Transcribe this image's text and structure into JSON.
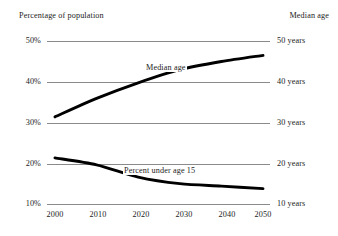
{
  "axis_titles": {
    "left": "Percentage of population",
    "right": "Median age"
  },
  "left_ticks": [
    "50%",
    "40%",
    "30%",
    "20%",
    "10%"
  ],
  "right_ticks": [
    "50 years",
    "40 years",
    "30 years",
    "20 years",
    "10 years"
  ],
  "x_ticks": [
    "2000",
    "2010",
    "2020",
    "2030",
    "2040",
    "2050"
  ],
  "series_labels": {
    "median": "Median age",
    "under15": "Percent under age 15"
  },
  "colors": {
    "line": "#000000",
    "gridline": "#8a8a8a",
    "background": "#ffffff",
    "text": "#1c1c1c"
  },
  "chart_data": {
    "type": "line",
    "title": "",
    "xlabel": "",
    "ylabel": "Percentage of population",
    "y2label": "Median age",
    "x": [
      2000,
      2010,
      2020,
      2030,
      2040,
      2050
    ],
    "xlim": [
      2000,
      2050
    ],
    "ylim": [
      10,
      50
    ],
    "y2lim": [
      10,
      50
    ],
    "yticks": [
      10,
      20,
      30,
      40,
      50
    ],
    "ytick_labels": [
      "10%",
      "20%",
      "30%",
      "40%",
      "50%"
    ],
    "y2ticks": [
      10,
      20,
      30,
      40,
      50
    ],
    "y2tick_labels": [
      "10 years",
      "20 years",
      "30 years",
      "40 years",
      "50 years"
    ],
    "xticks": [
      2000,
      2010,
      2020,
      2030,
      2040,
      2050
    ],
    "grid": true,
    "grid_axis": "y",
    "legend": "inline-annotations",
    "series": [
      {
        "name": "Median age",
        "axis": "right",
        "unit": "years",
        "values": [
          31.5,
          36.0,
          39.8,
          43.0,
          45.0,
          46.5
        ]
      },
      {
        "name": "Percent under age 15",
        "axis": "left",
        "unit": "%",
        "values": [
          21.5,
          19.8,
          16.8,
          15.2,
          14.6,
          14.0
        ]
      }
    ],
    "annotations": [
      {
        "text": "Median age",
        "x": 2035,
        "y": 43.5
      },
      {
        "text": "Percent under age 15",
        "x": 2032,
        "y": 17.2
      }
    ]
  }
}
